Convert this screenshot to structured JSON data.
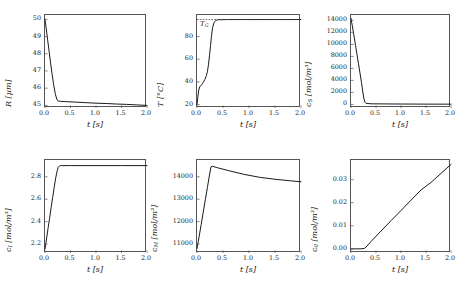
{
  "figure": {
    "background": "#ffffff",
    "curve_color": "#1a1a1a",
    "axis_color": "#555555",
    "width": 468,
    "height": 291
  },
  "shared": {
    "xlabel": "t [s]",
    "xticks": [
      "0.0",
      "0.5",
      "1.0",
      "1.5",
      "2.0"
    ],
    "xlim": [
      0,
      2
    ]
  },
  "chart_data": [
    {
      "id": "panel-radius",
      "type": "line",
      "title": "",
      "xlabel": "t [s]",
      "ylabel": "R [µm]",
      "ylabel_symbol": "R",
      "ylabel_unit": "[µm]",
      "xlim": [
        0,
        2
      ],
      "ylim": [
        44.85,
        50.25
      ],
      "xticks": [
        "0.0",
        "0.5",
        "1.0",
        "1.5",
        "2.0"
      ],
      "xtickvals": [
        0,
        0.5,
        1,
        1.5,
        2
      ],
      "yticks": [
        "45",
        "46",
        "47",
        "48",
        "49",
        "50"
      ],
      "ytickvals": [
        45,
        46,
        47,
        48,
        49,
        50
      ],
      "grid": false,
      "legend": "none",
      "series": [
        {
          "name": "R(t)",
          "x": [
            0.0,
            0.02,
            0.05,
            0.08,
            0.11,
            0.14,
            0.17,
            0.2,
            0.23,
            0.25,
            0.27,
            0.3,
            0.4,
            0.6,
            0.8,
            1.0,
            1.2,
            1.4,
            1.6,
            1.8,
            2.0
          ],
          "y": [
            50.0,
            49.55,
            48.85,
            48.15,
            47.45,
            46.8,
            46.2,
            45.7,
            45.37,
            45.27,
            45.25,
            45.24,
            45.22,
            45.19,
            45.16,
            45.13,
            45.11,
            45.08,
            45.06,
            45.03,
            45.0
          ]
        }
      ]
    },
    {
      "id": "panel-temperature",
      "type": "line",
      "title": "",
      "xlabel": "t [s]",
      "ylabel": "T [°C]",
      "ylabel_symbol": "T",
      "ylabel_unit": "[°C]",
      "xlim": [
        0,
        2
      ],
      "ylim": [
        17,
        99
      ],
      "xticks": [
        "0.0",
        "0.5",
        "1.0",
        "1.5",
        "2.0"
      ],
      "xtickvals": [
        0,
        0.5,
        1,
        1.5,
        2
      ],
      "yticks": [
        "20",
        "40",
        "60",
        "80"
      ],
      "ytickvals": [
        20,
        40,
        60,
        80
      ],
      "grid": false,
      "legend": "none",
      "annotations": [
        {
          "text": "T_G",
          "symbol": "T",
          "subscript": "G",
          "value": 95,
          "style": "dashed-horizontal-line"
        }
      ],
      "series": [
        {
          "name": "T(t)",
          "x": [
            0.0,
            0.015,
            0.03,
            0.05,
            0.07,
            0.09,
            0.12,
            0.15,
            0.18,
            0.2,
            0.22,
            0.24,
            0.26,
            0.28,
            0.3,
            0.33,
            0.36,
            0.4,
            0.6,
            1.0,
            1.5,
            2.0
          ],
          "y": [
            20.0,
            26.0,
            32.0,
            35.5,
            36.5,
            37.5,
            39.5,
            42.0,
            45.5,
            49.0,
            55.0,
            63.0,
            72.0,
            81.0,
            88.0,
            92.5,
            94.2,
            94.8,
            95.0,
            95.0,
            95.0,
            95.0
          ]
        },
        {
          "name": "T_G",
          "x": [
            0.0,
            2.0
          ],
          "y": [
            95.0,
            95.0
          ],
          "style": "dashed"
        }
      ]
    },
    {
      "id": "panel-cs",
      "type": "line",
      "title": "",
      "xlabel": "t [s]",
      "ylabel": "c_S [mol/m^3]",
      "ylabel_symbol": "c",
      "ylabel_subscript": "S",
      "ylabel_unit": "[mol/m³]",
      "xlim": [
        0,
        2
      ],
      "ylim": [
        -600,
        14900
      ],
      "xticks": [
        "0.0",
        "0.5",
        "1.0",
        "1.5",
        "2.0"
      ],
      "xtickvals": [
        0,
        0.5,
        1,
        1.5,
        2
      ],
      "yticks": [
        "0",
        "2000",
        "4000",
        "6000",
        "8000",
        "10000",
        "12000",
        "14000"
      ],
      "ytickvals": [
        0,
        2000,
        4000,
        6000,
        8000,
        10000,
        12000,
        14000
      ],
      "grid": false,
      "legend": "none",
      "series": [
        {
          "name": "c_S(t)",
          "x": [
            0.0,
            0.03,
            0.06,
            0.09,
            0.12,
            0.15,
            0.18,
            0.21,
            0.24,
            0.26,
            0.28,
            0.3,
            0.4,
            0.8,
            1.2,
            1.6,
            2.0
          ],
          "y": [
            14350,
            12900,
            11400,
            9850,
            8300,
            6750,
            5200,
            3600,
            1900,
            900,
            350,
            180,
            100,
            70,
            55,
            45,
            40
          ]
        }
      ]
    },
    {
      "id": "panel-ci",
      "type": "line",
      "title": "",
      "xlabel": "t [s]",
      "ylabel": "c_I [mol/m^3]",
      "ylabel_symbol": "c",
      "ylabel_subscript": "I",
      "ylabel_unit": "[mol/m³]",
      "xlim": [
        0,
        2
      ],
      "ylim": [
        2.12,
        2.95
      ],
      "xticks": [
        "0.0",
        "0.5",
        "1.0",
        "1.5",
        "2.0"
      ],
      "xtickvals": [
        0,
        0.5,
        1,
        1.5,
        2
      ],
      "yticks": [
        "2.2",
        "2.4",
        "2.6",
        "2.8"
      ],
      "ytickvals": [
        2.2,
        2.4,
        2.6,
        2.8
      ],
      "grid": false,
      "legend": "none",
      "series": [
        {
          "name": "c_I(t)",
          "x": [
            0.0,
            0.03,
            0.06,
            0.09,
            0.12,
            0.15,
            0.18,
            0.21,
            0.24,
            0.26,
            0.28,
            0.3,
            0.35,
            0.5,
            1.0,
            1.5,
            2.0
          ],
          "y": [
            2.155,
            2.245,
            2.34,
            2.43,
            2.525,
            2.615,
            2.705,
            2.79,
            2.855,
            2.885,
            2.895,
            2.9,
            2.9,
            2.9,
            2.9,
            2.9,
            2.9
          ]
        }
      ]
    },
    {
      "id": "panel-cm",
      "type": "line",
      "title": "",
      "xlabel": "t [s]",
      "ylabel": "c_M [mol/m^3]",
      "ylabel_symbol": "c",
      "ylabel_subscript": "M",
      "ylabel_unit": "[mol/m³]",
      "xlim": [
        0,
        2
      ],
      "ylim": [
        10600,
        14750
      ],
      "xticks": [
        "0.0",
        "0.5",
        "1.0",
        "1.5",
        "2.0"
      ],
      "xtickvals": [
        0,
        0.5,
        1,
        1.5,
        2
      ],
      "yticks": [
        "11000",
        "12000",
        "13000",
        "14000"
      ],
      "ytickvals": [
        11000,
        12000,
        13000,
        14000
      ],
      "grid": false,
      "legend": "none",
      "series": [
        {
          "name": "c_M(t)",
          "x": [
            0.0,
            0.04,
            0.08,
            0.12,
            0.16,
            0.2,
            0.24,
            0.27,
            0.3,
            0.4,
            0.6,
            0.9,
            1.2,
            1.5,
            1.8,
            2.0
          ],
          "y": [
            10800,
            11320,
            11870,
            12420,
            12980,
            13520,
            14080,
            14450,
            14470,
            14400,
            14280,
            14110,
            13980,
            13890,
            13820,
            13780
          ]
        }
      ]
    },
    {
      "id": "panel-c0",
      "type": "line",
      "title": "",
      "xlabel": "t [s]",
      "ylabel": "c_0 [mol/m^3]",
      "ylabel_symbol": "c",
      "ylabel_subscript": "0",
      "ylabel_unit": "[mol/m³]",
      "xlim": [
        0,
        2
      ],
      "ylim": [
        -0.0018,
        0.0385
      ],
      "xticks": [
        "0.0",
        "0.5",
        "1.0",
        "1.5",
        "2.0"
      ],
      "xtickvals": [
        0,
        0.5,
        1,
        1.5,
        2
      ],
      "yticks": [
        "0.00",
        "0.01",
        "0.02",
        "0.03"
      ],
      "ytickvals": [
        0.0,
        0.01,
        0.02,
        0.03
      ],
      "grid": false,
      "legend": "none",
      "series": [
        {
          "name": "c_0(t)",
          "x": [
            0.0,
            0.1,
            0.2,
            0.27,
            0.32,
            0.4,
            0.6,
            0.8,
            1.0,
            1.2,
            1.4,
            1.6,
            1.8,
            2.0
          ],
          "y": [
            0.0,
            0.0,
            0.0,
            0.0002,
            0.0012,
            0.0032,
            0.0077,
            0.0122,
            0.0166,
            0.0211,
            0.0255,
            0.0288,
            0.0327,
            0.0366
          ]
        }
      ]
    }
  ]
}
